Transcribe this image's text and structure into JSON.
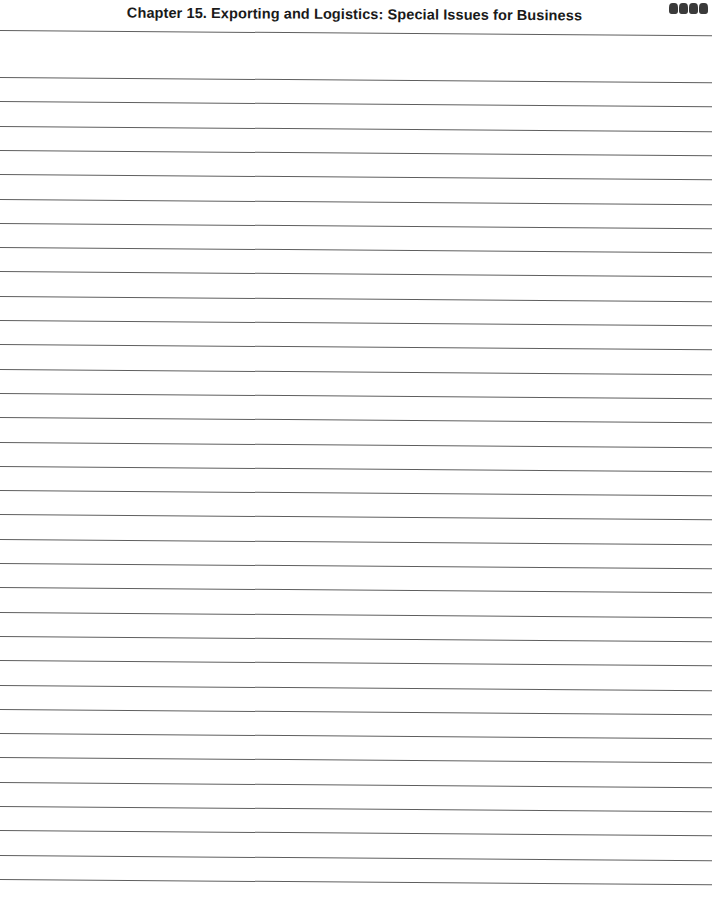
{
  "header": {
    "title": "Chapter 15. Exporting and Logistics: Special Issues for Business"
  },
  "ruled_lines": {
    "count": 35,
    "first_y": 30,
    "second_y": 77,
    "spacing": 24.3,
    "color": "#5e5e5e"
  }
}
